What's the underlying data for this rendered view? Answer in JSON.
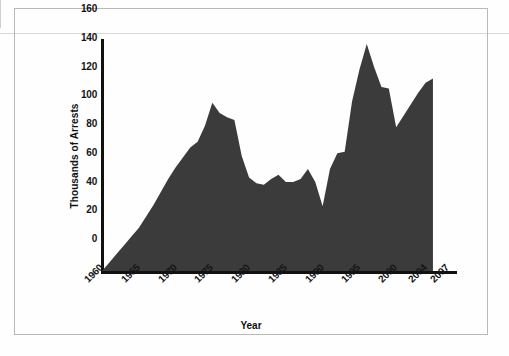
{
  "chart_data": {
    "type": "area",
    "title": "",
    "xlabel": "Year",
    "ylabel": "Thousands of Arrests",
    "xlim": [
      1960,
      2008
    ],
    "ylim": [
      0,
      160
    ],
    "grid": false,
    "legend": null,
    "fill_color": "#3b3b3b",
    "x": [
      1960,
      1961,
      1962,
      1963,
      1964,
      1965,
      1966,
      1967,
      1968,
      1969,
      1970,
      1971,
      1972,
      1973,
      1974,
      1975,
      1976,
      1977,
      1978,
      1979,
      1980,
      1981,
      1982,
      1983,
      1984,
      1985,
      1986,
      1987,
      1988,
      1989,
      1990,
      1991,
      1992,
      1993,
      1994,
      1995,
      1996,
      1997,
      1998,
      1999,
      2000,
      2001,
      2002,
      2003,
      2004,
      2005
    ],
    "values": [
      0,
      6,
      12,
      18,
      24,
      30,
      38,
      46,
      55,
      64,
      72,
      79,
      86,
      90,
      101,
      117,
      110,
      107,
      105,
      80,
      65,
      61,
      60,
      64,
      67,
      62,
      62,
      64,
      71,
      62,
      45,
      71,
      82,
      83,
      118,
      140,
      158,
      142,
      128,
      127,
      100,
      108,
      116,
      124,
      131,
      134
    ],
    "x_tick_labels": [
      "1960",
      "1965",
      "1970",
      "1975",
      "1980",
      "1985",
      "1990",
      "1995",
      "2000",
      "2004",
      "2007"
    ],
    "x_tick_values": [
      1960,
      1965,
      1970,
      1975,
      1980,
      1985,
      1990,
      1995,
      2000,
      2004,
      2007
    ],
    "y_tick_labels": [
      "0",
      "20",
      "40",
      "60",
      "80",
      "100",
      "120",
      "140",
      "160"
    ],
    "y_tick_values": [
      0,
      20,
      40,
      60,
      80,
      100,
      120,
      140,
      160
    ]
  }
}
